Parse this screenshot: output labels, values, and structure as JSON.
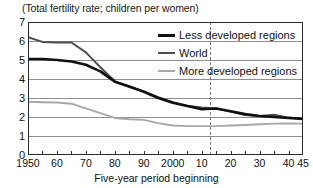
{
  "chart_data": {
    "type": "line",
    "title": "(Total fertility rate; children per women)",
    "xlabel": "Five-year period beginning",
    "ylabel": "",
    "xlim": [
      1950,
      2045
    ],
    "ylim": [
      0,
      7
    ],
    "grid": true,
    "legend_position": "top-right",
    "y_ticks": [
      "0",
      "1",
      "2",
      "3",
      "4",
      "5",
      "6",
      "7"
    ],
    "y_tick_values": [
      0,
      1,
      2,
      3,
      4,
      5,
      6,
      7
    ],
    "x_ticks": [
      "1950",
      "60",
      "70",
      "80",
      "90",
      "2000",
      "10",
      "20",
      "30",
      "40",
      "45"
    ],
    "x_tick_values": [
      1950,
      1960,
      1970,
      1980,
      1990,
      2000,
      2010,
      2020,
      2030,
      2040,
      2045
    ],
    "x_minor_tick_values": [
      1955,
      1965,
      1975,
      1985,
      1995,
      2005,
      2015,
      2025,
      2035
    ],
    "x": [
      1950,
      1955,
      1960,
      1965,
      1970,
      1975,
      1980,
      1985,
      1990,
      1995,
      2000,
      2005,
      2010,
      2015,
      2020,
      2025,
      2030,
      2035,
      2040,
      2045
    ],
    "series": [
      {
        "name": "Less developed regions",
        "color": "#101010",
        "width": 2.6,
        "values": [
          5.05,
          5.05,
          5.0,
          4.92,
          4.75,
          4.4,
          3.86,
          3.6,
          3.33,
          3.0,
          2.75,
          2.58,
          2.41,
          2.45,
          2.3,
          2.15,
          2.05,
          2.0,
          1.95,
          1.9
        ]
      },
      {
        "name": "World",
        "color": "#4d4d4d",
        "width": 1.9,
        "values": [
          6.2,
          5.95,
          5.92,
          5.92,
          5.4,
          4.62,
          3.88,
          3.58,
          3.35,
          3.05,
          2.78,
          2.6,
          2.5,
          2.45,
          2.28,
          2.1,
          2.05,
          2.12,
          1.97,
          1.9
        ]
      },
      {
        "name": "More developed regions",
        "color": "#a8a8a8",
        "width": 1.9,
        "values": [
          2.8,
          2.78,
          2.76,
          2.7,
          2.45,
          2.2,
          1.95,
          1.88,
          1.85,
          1.68,
          1.55,
          1.52,
          1.52,
          1.52,
          1.55,
          1.58,
          1.62,
          1.65,
          1.66,
          1.65
        ]
      }
    ],
    "annotations": [
      {
        "name": "projection-divider",
        "type": "vline",
        "x": 2013,
        "style": "dashed",
        "color": "#7a7a7a"
      }
    ]
  },
  "legend": {
    "items": [
      {
        "label": "Less developed regions",
        "color": "#101010",
        "thickness": "3px"
      },
      {
        "label": "World",
        "color": "#4d4d4d",
        "thickness": "2px"
      },
      {
        "label": "More developed regions",
        "color": "#a8a8a8",
        "thickness": "2px"
      }
    ]
  },
  "colors": {
    "background": "#ffffff",
    "axis": "#2b2b2b",
    "gridline": "#8f8f8f",
    "text": "#111111"
  }
}
